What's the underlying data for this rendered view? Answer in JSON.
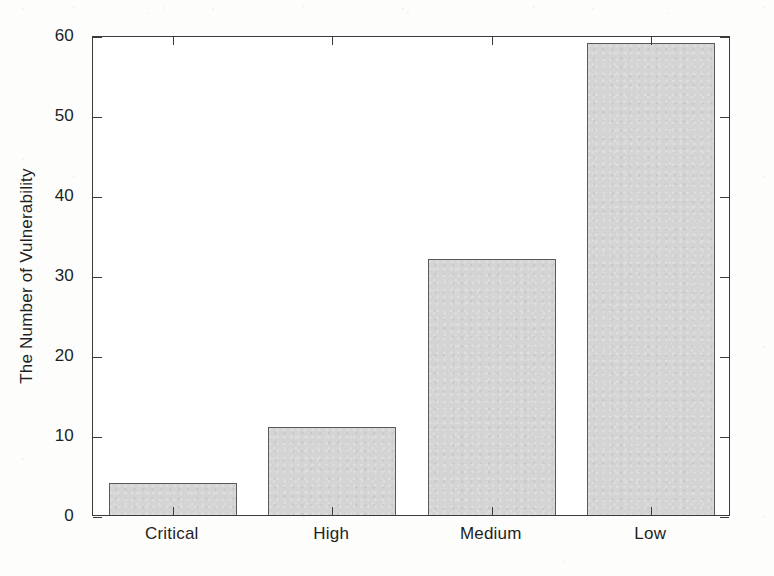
{
  "chart_data": {
    "type": "bar",
    "title": "",
    "xlabel": "",
    "ylabel": "The Number of Vulnerability",
    "categories": [
      "Critical",
      "High",
      "Medium",
      "Low"
    ],
    "values": [
      4,
      11,
      32,
      59
    ],
    "ylim": [
      0,
      60
    ],
    "yticks": [
      0,
      10,
      20,
      30,
      40,
      50,
      60
    ],
    "ytick_labels": [
      "0",
      "10",
      "20",
      "30",
      "40",
      "50",
      "60"
    ],
    "grid": false,
    "legend": null,
    "bar_fill_color": "#d4d4d4",
    "bar_edge_color": "#5a5a5a",
    "axis_color": "#3a3a3a",
    "background_color": "#ffffff"
  },
  "figure": {
    "bars": [
      {
        "label": "Critical",
        "value": 4
      },
      {
        "label": "High",
        "value": 11
      },
      {
        "label": "Medium",
        "value": 32
      },
      {
        "label": "Low",
        "value": 59
      }
    ]
  }
}
